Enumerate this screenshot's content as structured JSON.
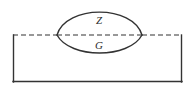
{
  "figure": {
    "type": "technical-cross-section-diagram",
    "background_color": "#ffffff",
    "line_color": "#333333",
    "canvas": {
      "width": 195,
      "height": 92
    },
    "base_rectangle": {
      "name": "base-material-rectangle",
      "x": 13,
      "y": 35,
      "width": 169,
      "height": 47,
      "top_edge_style": "dashed",
      "other_edges_style": "solid",
      "stroke_width": 1.4
    },
    "center_line": {
      "name": "weld-center-line",
      "y": 35,
      "x_start": 57,
      "x_end": 142,
      "style": "dashed",
      "dash_pattern": "5 3"
    },
    "lens": {
      "name": "weld-bead-lens",
      "left_vertex_x": 57,
      "right_vertex_x": 142,
      "vertex_y": 35,
      "upper_apex_y": 5,
      "lower_apex_y": 56,
      "stroke_width": 1.4
    },
    "labels": [
      {
        "id": "Z",
        "text": "Z",
        "x": 99,
        "y": 21,
        "region": "upper",
        "meaning": "upper-region-label"
      },
      {
        "id": "G",
        "text": "G",
        "x": 99,
        "y": 46,
        "region": "lower",
        "meaning": "lower-region-label"
      }
    ]
  }
}
